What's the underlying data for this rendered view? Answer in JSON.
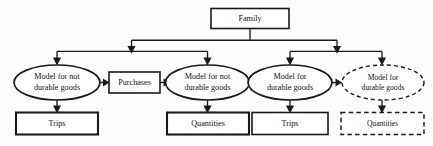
{
  "diagram": {
    "colors": {
      "stroke": "#1a1a1a",
      "fill": "#ffffff",
      "background": "#fdfdfd"
    },
    "nodes": {
      "root": {
        "label": "Family",
        "shape": "rectangle",
        "style": "solid"
      },
      "model_nondurable_1": {
        "line1": "Model for  not",
        "line2": "durable goods",
        "shape": "ellipse",
        "style": "solid"
      },
      "purchases": {
        "label": "Purchases",
        "shape": "rectangle",
        "style": "solid"
      },
      "model_nondurable_2": {
        "line1": "Model for  not",
        "line2": "durable goods",
        "shape": "ellipse",
        "style": "solid"
      },
      "model_durable_1": {
        "line1": "Model for",
        "line2": "durable goods",
        "shape": "ellipse",
        "style": "solid"
      },
      "model_durable_2": {
        "line1": "Model for",
        "line2": "durable goods",
        "shape": "ellipse",
        "style": "dashed"
      },
      "trips_1": {
        "label": "Trips",
        "shape": "rectangle",
        "style": "solid"
      },
      "quantities_1": {
        "label": "Quantities",
        "shape": "rectangle",
        "style": "solid"
      },
      "trips_2": {
        "label": "Trips",
        "shape": "rectangle",
        "style": "solid"
      },
      "quantities_2": {
        "label": "Quantities",
        "shape": "rectangle",
        "style": "dashed"
      }
    }
  }
}
